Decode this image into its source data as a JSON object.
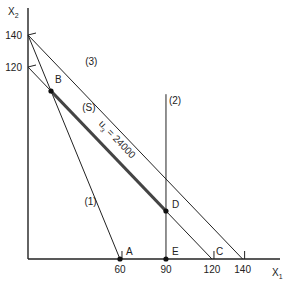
{
  "diagram": {
    "axes": {
      "x_label": "X",
      "x_label_sub": "1",
      "y_label": "X",
      "y_label_sub": "2",
      "x_ticks": [
        {
          "value": 60,
          "label": "60"
        },
        {
          "value": 90,
          "label": "90"
        },
        {
          "value": 120,
          "label": "120"
        },
        {
          "value": 140,
          "label": "140"
        }
      ],
      "y_ticks": [
        {
          "value": 140,
          "label": "140"
        },
        {
          "value": 120,
          "label": "120"
        }
      ],
      "x_max": 160,
      "y_max": 160
    },
    "lines": [
      {
        "id": "constraint-1",
        "label": "(1)",
        "from": [
          0,
          140
        ],
        "to": [
          60,
          0
        ]
      },
      {
        "id": "constraint-2",
        "label": "(2)",
        "from": [
          90,
          0
        ],
        "to": [
          90,
          103
        ]
      },
      {
        "id": "constraint-3",
        "label": "(3)",
        "from": [
          0,
          140
        ],
        "to": [
          140,
          0
        ]
      },
      {
        "id": "constraint-s",
        "label": "(S)",
        "from": [
          0,
          120
        ],
        "to": [
          120,
          0
        ]
      }
    ],
    "objective_segment": {
      "label": "u",
      "label_sub": "3",
      "label_rest": " = 24000",
      "from": [
        15,
        105
      ],
      "to": [
        90,
        30
      ]
    },
    "points": [
      {
        "name": "A",
        "x": 60,
        "y": 0,
        "dot": true
      },
      {
        "name": "B",
        "x": 15,
        "y": 105,
        "dot": true
      },
      {
        "name": "C",
        "x": 120,
        "y": 0,
        "dot": false
      },
      {
        "name": "D",
        "x": 90,
        "y": 30,
        "dot": true
      },
      {
        "name": "E",
        "x": 90,
        "y": 0,
        "dot": true
      }
    ]
  }
}
